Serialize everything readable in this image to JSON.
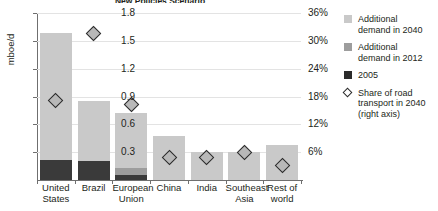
{
  "chart_data": {
    "type": "bar",
    "title": "New Policies Scenario",
    "xlabel": "",
    "ylabel": "mboe/d",
    "ylim": [
      0,
      1.8
    ],
    "yticks": [
      "0.3",
      "0.6",
      "0.9",
      "1.2",
      "1.5",
      "1.8"
    ],
    "ytick_values": [
      0.3,
      0.6,
      0.9,
      1.2,
      1.5,
      1.8
    ],
    "y2label": "",
    "y2lim": [
      0,
      36
    ],
    "y2ticks": [
      "6%",
      "12%",
      "18%",
      "24%",
      "30%",
      "36%"
    ],
    "y2tick_values": [
      6,
      12,
      18,
      24,
      30,
      36
    ],
    "grid": true,
    "legend_position": "right",
    "categories": [
      "United States",
      "Brazil",
      "European Union",
      "China",
      "India",
      "Southeast Asia",
      "Rest of world"
    ],
    "category_lines": [
      [
        "United",
        "States"
      ],
      [
        "Brazil",
        ""
      ],
      [
        "European",
        "Union"
      ],
      [
        "China",
        ""
      ],
      [
        "India",
        ""
      ],
      [
        "Southeast",
        "Asia"
      ],
      [
        "Rest of",
        "world"
      ]
    ],
    "series": [
      {
        "name": "2005",
        "color": "#3a3a3a",
        "values": [
          0.22,
          0.2,
          0.05,
          0.0,
          0.0,
          0.0,
          0.0
        ]
      },
      {
        "name": "Additional demand in 2012",
        "color": "#9d9d9d",
        "values": [
          0.0,
          0.0,
          0.08,
          0.0,
          0.0,
          0.0,
          0.0
        ]
      },
      {
        "name": "Additional demand in 2040",
        "color": "#c9c9c9",
        "values": [
          1.37,
          0.65,
          0.59,
          0.47,
          0.3,
          0.3,
          0.38
        ]
      }
    ],
    "totals": [
      1.59,
      0.85,
      0.72,
      0.47,
      0.3,
      0.3,
      0.38
    ],
    "marker_series": {
      "name": "Share of road transport in 2040 (right axis)",
      "axis": "right",
      "values_pct": [
        17.2,
        31.6,
        16.2,
        4.8,
        4.8,
        6.0,
        3.2
      ],
      "values_left_scale": [
        0.86,
        1.58,
        0.81,
        0.24,
        0.24,
        0.3,
        0.16
      ]
    },
    "legend": [
      {
        "label_line1": "Additional",
        "label_line2": "demand in 2040",
        "swatch": "sw-2040",
        "icon": "square-swatch-light"
      },
      {
        "label_line1": "Additional",
        "label_line2": "demand in 2012",
        "swatch": "sw-2012",
        "icon": "square-swatch-mid"
      },
      {
        "label_line1": "2005",
        "label_line2": "",
        "swatch": "sw-2005",
        "icon": "square-swatch-dark"
      },
      {
        "label_line1": "Share of road",
        "label_line2": "transport in 2040 (right axis)",
        "swatch": "sw-diamond",
        "icon": "diamond-marker"
      }
    ]
  }
}
